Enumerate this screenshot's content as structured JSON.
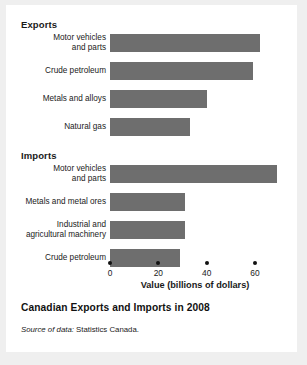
{
  "figure": {
    "caption_title": "Canadian Exports and Imports in 2008",
    "source_lead": "Source of data:",
    "source_body": "Statistics Canada."
  },
  "chart_data": {
    "type": "bar",
    "orientation": "horizontal",
    "title": "Canadian Exports and Imports in 2008",
    "xlabel": "Value (billions of dollars)",
    "ylabel": "",
    "xlim": [
      0,
      72
    ],
    "xticks": [
      0,
      20,
      40,
      60
    ],
    "xticklabels": [
      "0",
      "20",
      "40",
      "60"
    ],
    "grid": false,
    "legend": false,
    "bar_color": "#6e6e6e",
    "groups": [
      {
        "name": "Exports",
        "items": [
          {
            "label_lines": [
              "Motor vehicles",
              "and parts"
            ],
            "value": 62
          },
          {
            "label_lines": [
              "Crude petroleum"
            ],
            "value": 59
          },
          {
            "label_lines": [
              "Metals and alloys"
            ],
            "value": 40
          },
          {
            "label_lines": [
              "Natural gas"
            ],
            "value": 33
          }
        ]
      },
      {
        "name": "Imports",
        "items": [
          {
            "label_lines": [
              "Motor vehicles",
              "and parts"
            ],
            "value": 69
          },
          {
            "label_lines": [
              "Metals and metal ores"
            ],
            "value": 31
          },
          {
            "label_lines": [
              "Industrial and",
              "agricultural machinery"
            ],
            "value": 31
          },
          {
            "label_lines": [
              "Crude petroleum"
            ],
            "value": 29
          }
        ]
      }
    ]
  }
}
